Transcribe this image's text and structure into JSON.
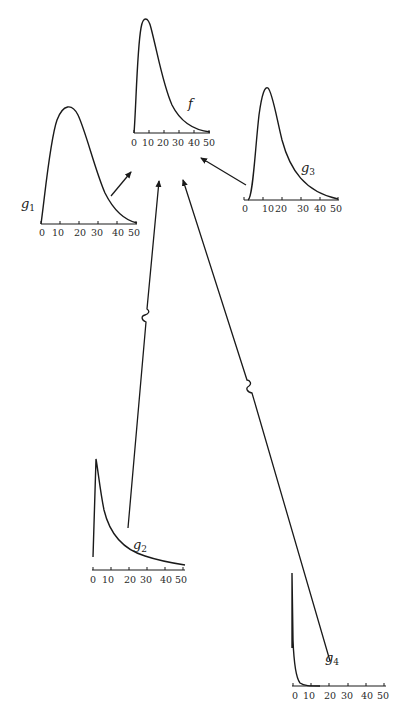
{
  "diagram": {
    "tick_values": [
      "0",
      "10",
      "20",
      "30",
      "40",
      "50"
    ],
    "panels": {
      "f": {
        "label": "f",
        "sub": "",
        "shape": "right-skewed unimodal, peak near 12"
      },
      "g1": {
        "label": "g",
        "sub": "1",
        "shape": "right-skewed unimodal, peak near 14"
      },
      "g2": {
        "label": "g",
        "sub": "2",
        "shape": "sharp peak near 2, long tail"
      },
      "g3": {
        "label": "g",
        "sub": "3",
        "shape": "right-skewed unimodal, peak near 12"
      },
      "g4": {
        "label": "g",
        "sub": "4",
        "shape": "spike at 0, rapid decay"
      }
    },
    "arrows": [
      {
        "from": "g1",
        "to": "f",
        "broken": false
      },
      {
        "from": "g3",
        "to": "f",
        "broken": false
      },
      {
        "from": "g2",
        "to": "f",
        "broken": true
      },
      {
        "from": "g4",
        "to": "f",
        "broken": true
      }
    ],
    "colors": {
      "ink": "#1a1a1a",
      "background": "#ffffff"
    }
  }
}
